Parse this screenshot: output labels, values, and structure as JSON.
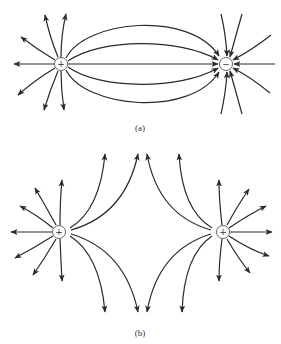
{
  "figure": {
    "panel_a": {
      "caption": "(a)",
      "description": "Electric field lines between a positive and a negative point charge (dipole)",
      "charges": [
        {
          "sign": "+",
          "symbol": "+",
          "x": 61,
          "y": 64
        },
        {
          "sign": "-",
          "symbol": "−",
          "x": 226,
          "y": 64
        }
      ]
    },
    "panel_b": {
      "caption": "(b)",
      "description": "Electric field lines between two equal positive point charges",
      "charges": [
        {
          "sign": "+",
          "symbol": "+",
          "x": 59,
          "y": 232
        },
        {
          "sign": "+",
          "symbol": "+",
          "x": 223,
          "y": 232
        }
      ]
    },
    "colors": {
      "line": "#2a2a2a",
      "charge_outline": "#555555",
      "background": "#ffffff"
    }
  }
}
